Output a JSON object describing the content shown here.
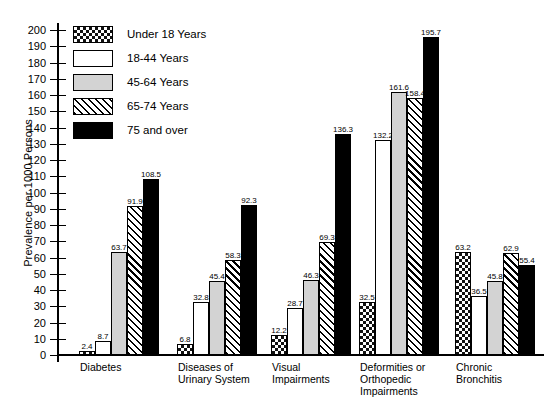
{
  "chart_data": {
    "type": "bar",
    "title": "",
    "xlabel": "",
    "ylabel": "Prevalence per 1000 Persons",
    "ylim": [
      0,
      200
    ],
    "ytick_step": 10,
    "yticks": [
      200,
      190,
      180,
      170,
      160,
      150,
      140,
      130,
      120,
      110,
      100,
      90,
      80,
      70,
      60,
      50,
      40,
      30,
      20,
      10,
      0
    ],
    "grid": false,
    "legend_position": "top-left-inside",
    "categories": [
      "Diabetes",
      "Diseases of\nUrinary System",
      "Visual\nImpairments",
      "Deformities or\nOrthopedic\nImpairments",
      "Chronic\nBronchitis"
    ],
    "series": [
      {
        "name": "Under 18 Years",
        "pattern": "checkerboard",
        "values": [
          2.4,
          6.8,
          12.2,
          32.5,
          63.2
        ]
      },
      {
        "name": "18-44 Years",
        "pattern": "white",
        "values": [
          8.7,
          32.8,
          28.7,
          132.2,
          36.5
        ]
      },
      {
        "name": "45-64 Years",
        "pattern": "light-gray",
        "values": [
          63.7,
          45.4,
          46.3,
          161.6,
          45.8
        ]
      },
      {
        "name": "65-74 Years",
        "pattern": "diagonal-hatch",
        "values": [
          91.9,
          58.3,
          69.3,
          158.4,
          62.9
        ]
      },
      {
        "name": "75 and over",
        "pattern": "solid-black",
        "values": [
          108.5,
          92.3,
          136.3,
          195.7,
          55.4
        ]
      }
    ]
  },
  "legend": {
    "items": [
      {
        "label": "Under 18 Years"
      },
      {
        "label": "18-44 Years"
      },
      {
        "label": "45-64 Years"
      },
      {
        "label": "65-74 Years"
      },
      {
        "label": "75 and over"
      }
    ]
  },
  "colors": {
    "axis": "#000000",
    "gray_fill": "#d3d3d3",
    "black_fill": "#000000",
    "white_fill": "#ffffff"
  }
}
